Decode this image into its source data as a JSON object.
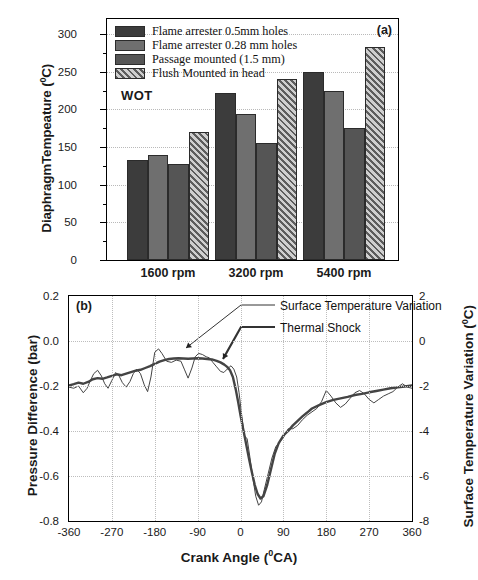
{
  "figure": {
    "panel_a_label": "(a)",
    "panel_b_label": "(b)",
    "annotation_wot": "WOT"
  },
  "chart_data": [
    {
      "type": "bar",
      "title": "(a)",
      "xlabel": "",
      "ylabel": "DiaphragmTempeature (0C)",
      "ylabel_text": "DiaphragmTempeature (",
      "ylabel_sup": "0",
      "ylabel_tail": "C)",
      "ylim": [
        0,
        320
      ],
      "yticks": [
        0,
        50,
        100,
        150,
        200,
        250,
        300
      ],
      "ytick_labels": [
        "0",
        "50",
        "100",
        "150",
        "200",
        "250",
        "300"
      ],
      "yminor_step": 25,
      "grid": "horizontal-dotted",
      "categories": [
        "1600 rpm",
        "3200 rpm",
        "5400 rpm"
      ],
      "legend_position": "top-left",
      "series": [
        {
          "name": "Flame arrester 0.5mm holes",
          "color": "#3c3c3c",
          "pattern": "solid",
          "values": [
            133,
            222,
            249
          ]
        },
        {
          "name": "Flame arrester 0.28 mm holes",
          "color": "#6f6f6f",
          "pattern": "solid",
          "values": [
            140,
            194,
            224
          ]
        },
        {
          "name": "Passage mounted (1.5 mm)",
          "color": "#555555",
          "pattern": "solid",
          "values": [
            127,
            156,
            175
          ]
        },
        {
          "name": "Flush Mounted in head",
          "color": "#9a9a9a",
          "pattern": "hatch",
          "values": [
            170,
            240,
            283
          ]
        }
      ],
      "annotation": "WOT"
    },
    {
      "type": "line",
      "title": "(b)",
      "xlabel": "Crank Angle (0CA)",
      "xlabel_text": "Crank Angle (",
      "xlabel_sup": "0",
      "xlabel_tail": "CA)",
      "ylabel_left": "Pressure Difference (bar)",
      "ylabel_right": "Surface Temperature Variation (0C)",
      "ylabel_right_text": "Surface Temperature Variation (",
      "ylabel_right_sup": "0",
      "ylabel_right_tail": "C)",
      "xlim": [
        -360,
        360
      ],
      "xticks": [
        -360,
        -270,
        -180,
        -90,
        0,
        90,
        180,
        270,
        360
      ],
      "xtick_labels": [
        "-360",
        "-270",
        "-180",
        "-90",
        "0",
        "90",
        "180",
        "270",
        "360"
      ],
      "ylim_left": [
        -0.8,
        0.2
      ],
      "yticks_left": [
        0.2,
        0.0,
        -0.2,
        -0.4,
        -0.6,
        -0.8
      ],
      "ytick_labels_left": [
        "0.2",
        "0.0",
        "-0.2",
        "-0.4",
        "-0.6",
        "-0.8"
      ],
      "ylim_right": [
        -8,
        2
      ],
      "yticks_right": [
        2,
        0,
        -2,
        -4,
        -6,
        -8
      ],
      "ytick_labels_right": [
        "2",
        "0",
        "-2",
        "-4",
        "-6",
        "-8"
      ],
      "grid": "both-dotted",
      "legend_position": "top-right-callouts",
      "series": [
        {
          "name": "Surface Temperature Variation",
          "axis": "right",
          "style": "thin",
          "points_x": [
            -360,
            -350,
            -340,
            -330,
            -322,
            -315,
            -308,
            -300,
            -292,
            -285,
            -278,
            -270,
            -262,
            -255,
            -248,
            -240,
            -232,
            -225,
            -218,
            -210,
            -202,
            -195,
            -188,
            -180,
            -172,
            -165,
            -155,
            -145,
            -135,
            -125,
            -118,
            -110,
            -102,
            -95,
            -88,
            -80,
            -72,
            -65,
            -58,
            -50,
            -42,
            -35,
            -28,
            -20,
            -14,
            -8,
            -3,
            2,
            8,
            14,
            20,
            26,
            32,
            38,
            44,
            50,
            58,
            66,
            74,
            82,
            90,
            100,
            110,
            120,
            130,
            140,
            150,
            160,
            170,
            180,
            190,
            200,
            210,
            220,
            230,
            240,
            250,
            260,
            270,
            280,
            290,
            300,
            310,
            320,
            330,
            340,
            350,
            360
          ],
          "points_y": [
            -2.05,
            -2.1,
            -2.0,
            -2.3,
            -2.1,
            -1.75,
            -1.45,
            -1.3,
            -1.55,
            -1.9,
            -2.1,
            -1.75,
            -1.4,
            -1.55,
            -1.85,
            -2.05,
            -1.8,
            -1.45,
            -1.25,
            -1.45,
            -1.95,
            -2.25,
            -1.6,
            -0.5,
            -0.35,
            -0.55,
            -0.9,
            -0.95,
            -0.85,
            -0.9,
            -1.25,
            -1.65,
            -1.2,
            -0.7,
            -0.55,
            -0.6,
            -0.7,
            -0.75,
            -0.95,
            -1.15,
            -1.35,
            -1.4,
            -1.25,
            -1.1,
            -1.25,
            -1.6,
            -2.3,
            -3.2,
            -4.2,
            -4.35,
            -5.2,
            -6.1,
            -6.9,
            -7.3,
            -7.15,
            -6.6,
            -5.9,
            -5.2,
            -4.7,
            -4.5,
            -4.3,
            -3.9,
            -3.9,
            -3.75,
            -3.5,
            -3.3,
            -3.15,
            -3.0,
            -2.7,
            -2.2,
            -2.45,
            -2.75,
            -2.95,
            -2.8,
            -2.55,
            -2.3,
            -2.2,
            -2.35,
            -2.6,
            -2.75,
            -2.6,
            -2.45,
            -2.35,
            -2.25,
            -2.05,
            -1.9,
            -2.05,
            -2.1
          ]
        },
        {
          "name": "Thermal Shock",
          "axis": "left",
          "style": "thick",
          "points_x": [
            -360,
            -350,
            -340,
            -330,
            -320,
            -310,
            -300,
            -290,
            -280,
            -270,
            -260,
            -250,
            -240,
            -230,
            -220,
            -210,
            -200,
            -190,
            -180,
            -170,
            -160,
            -150,
            -140,
            -130,
            -120,
            -110,
            -100,
            -90,
            -80,
            -70,
            -60,
            -50,
            -42,
            -34,
            -28,
            -22,
            -16,
            -10,
            -5,
            0,
            6,
            12,
            18,
            24,
            30,
            36,
            42,
            48,
            56,
            64,
            72,
            80,
            90,
            100,
            110,
            120,
            130,
            140,
            150,
            165,
            180,
            195,
            210,
            225,
            240,
            255,
            270,
            285,
            300,
            315,
            330,
            345,
            360
          ],
          "points_y": [
            -0.198,
            -0.192,
            -0.185,
            -0.19,
            -0.182,
            -0.17,
            -0.165,
            -0.168,
            -0.162,
            -0.155,
            -0.148,
            -0.152,
            -0.145,
            -0.138,
            -0.132,
            -0.128,
            -0.12,
            -0.112,
            -0.102,
            -0.092,
            -0.085,
            -0.08,
            -0.078,
            -0.077,
            -0.078,
            -0.079,
            -0.078,
            -0.077,
            -0.078,
            -0.08,
            -0.082,
            -0.088,
            -0.095,
            -0.105,
            -0.115,
            -0.13,
            -0.16,
            -0.215,
            -0.27,
            -0.33,
            -0.395,
            -0.46,
            -0.525,
            -0.585,
            -0.64,
            -0.68,
            -0.7,
            -0.69,
            -0.64,
            -0.57,
            -0.5,
            -0.455,
            -0.42,
            -0.4,
            -0.375,
            -0.355,
            -0.335,
            -0.318,
            -0.3,
            -0.285,
            -0.272,
            -0.262,
            -0.255,
            -0.248,
            -0.24,
            -0.235,
            -0.228,
            -0.222,
            -0.216,
            -0.21,
            -0.206,
            -0.202,
            -0.198
          ]
        }
      ],
      "callouts": [
        {
          "label": "Surface Temperature Variation"
        },
        {
          "label": "Thermal Shock"
        }
      ]
    }
  ]
}
